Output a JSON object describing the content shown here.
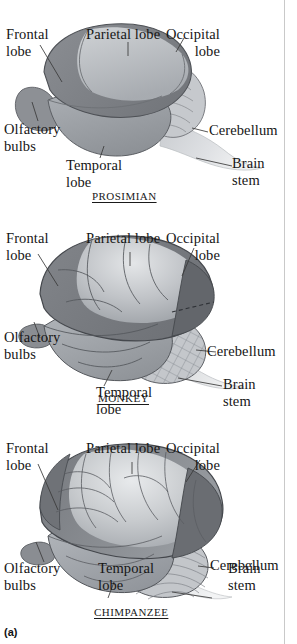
{
  "figure": {
    "caption": "(a)",
    "palette": {
      "background": "#ffffff",
      "text": "#161616",
      "leader_line": "#3a3a3a",
      "outline": "#2b2b2b",
      "frontal_lobe": "#7e8186",
      "parietal_lobe": "#b9bcc0",
      "temporal_lobe": "#9a9ea3",
      "occipital_lobe": "#6e7175",
      "cerebellum": "#c6c9cd",
      "brain_stem": "#d8dadd",
      "olfactory_bulb": "#8d9095",
      "edge_rule": "#c9c9c9"
    }
  },
  "panels": [
    {
      "id": "prosimian",
      "species_label": "PROSIMIAN",
      "labels": {
        "frontal": "Frontal\nlobe",
        "frontal_line1": "Frontal",
        "frontal_line2": "lobe",
        "parietal": "Parietal lobe",
        "occipital_line1": "Occipital",
        "occipital_line2": "lobe",
        "olfactory_line1": "Olfactory",
        "olfactory_line2": "bulbs",
        "temporal_line1": "Temporal",
        "temporal_line2": "lobe",
        "cerebellum": "Cerebellum",
        "brainstem_line1": "Brain",
        "brainstem_line2": "stem"
      }
    },
    {
      "id": "monkey",
      "species_label": "MONKEY",
      "labels": {
        "frontal_line1": "Frontal",
        "frontal_line2": "lobe",
        "parietal": "Parietal lobe",
        "occipital_line1": "Occipital",
        "occipital_line2": "lobe",
        "olfactory_line1": "Olfactory",
        "olfactory_line2": "bulbs",
        "temporal_line1": "Temporal",
        "temporal_line2": "lobe",
        "cerebellum": "Cerebellum",
        "brainstem_line1": "Brain",
        "brainstem_line2": "stem"
      }
    },
    {
      "id": "chimpanzee",
      "species_label": "CHIMPANZEE",
      "labels": {
        "frontal_line1": "Frontal",
        "frontal_line2": "lobe",
        "parietal": "Parietal lobe",
        "occipital_line1": "Occipital",
        "occipital_line2": "lobe",
        "olfactory_line1": "Olfactory",
        "olfactory_line2": "bulbs",
        "temporal_line1": "Temporal",
        "temporal_line2": "lobe",
        "cerebellum": "Cerebellum",
        "brainstem_line1": "Brain",
        "brainstem_line2": "stem"
      }
    }
  ]
}
